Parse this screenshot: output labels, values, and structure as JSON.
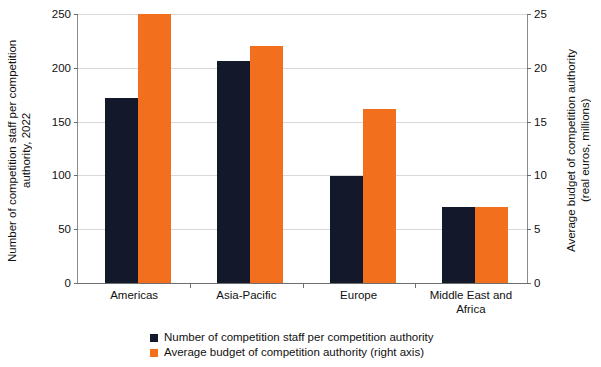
{
  "chart_data": {
    "type": "bar",
    "title": "",
    "categories": [
      "Americas",
      "Asia-Pacific",
      "Europe",
      "Middle East and\nAfrica"
    ],
    "series": [
      {
        "name": "Number of competition staff per competition authority",
        "axis": "left",
        "color": "#13182a",
        "values": [
          172,
          206,
          99,
          71
        ]
      },
      {
        "name": "Average budget of competition authority (right axis)",
        "axis": "right",
        "color": "#f2701d",
        "values": [
          25.0,
          22.0,
          16.2,
          7.1
        ]
      }
    ],
    "xlabel": "",
    "ylabel": "Number of competition staff per competition\nauthority, 2022",
    "y2label": "Average budget of competition authority\n(real euros, millions)",
    "ylim": [
      0,
      250
    ],
    "y2lim": [
      0,
      25
    ],
    "yticks": [
      "0",
      "50",
      "100",
      "150",
      "200",
      "250"
    ],
    "y2ticks": [
      "0",
      "5",
      "10",
      "15",
      "20",
      "25"
    ],
    "grid": true,
    "legend_position": "bottom"
  },
  "axes": {
    "left_title": "Number of competition staff per competition\nauthority, 2022",
    "right_title": "Average budget of competition authority\n(real euros, millions)"
  },
  "legend": {
    "items": [
      {
        "label": "Number of competition staff per competition authority",
        "color": "#13182a"
      },
      {
        "label": "Average budget of competition authority (right axis)",
        "color": "#f2701d"
      }
    ]
  }
}
